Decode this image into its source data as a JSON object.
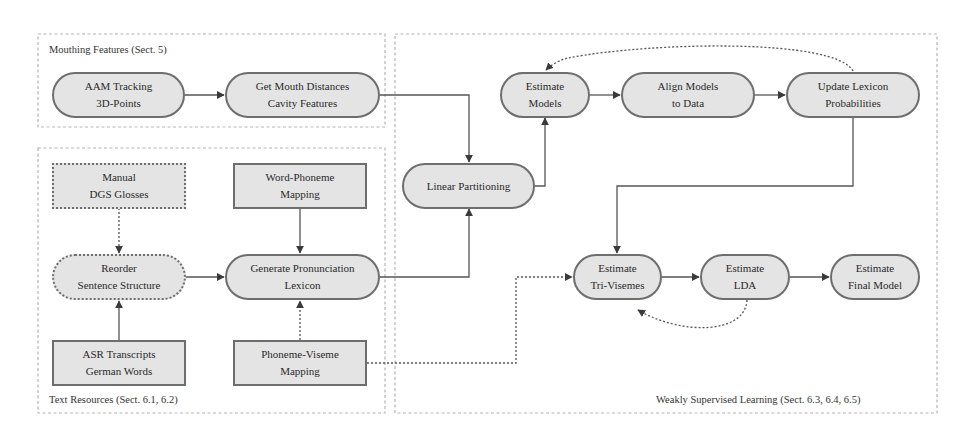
{
  "groups": {
    "mouthing": {
      "label": "Mouthing Features (Sect. 5)"
    },
    "text_resources": {
      "label": "Text Resources (Sect. 6.1, 6.2)"
    },
    "weakly_supervised": {
      "label": "Weakly Supervised Learning (Sect. 6.3, 6.4, 6.5)"
    }
  },
  "nodes": {
    "aam_tracking": {
      "line1": "AAM Tracking",
      "line2": "3D-Points",
      "shape": "pill"
    },
    "mouth_distances": {
      "line1": "Get Mouth Distances",
      "line2": "Cavity Features",
      "shape": "pill"
    },
    "manual_dgs": {
      "line1": "Manual",
      "line2": "DGS Glosses",
      "shape": "dotted-rect"
    },
    "word_phoneme": {
      "line1": "Word-Phoneme",
      "line2": "Mapping",
      "shape": "rect"
    },
    "reorder": {
      "line1": "Reorder",
      "line2": "Sentence Structure",
      "shape": "dotted-pill"
    },
    "generate_lexicon": {
      "line1": "Generate Pronunciation",
      "line2": "Lexicon",
      "shape": "pill"
    },
    "asr_transcripts": {
      "line1": "ASR Transcripts",
      "line2": "German Words",
      "shape": "rect"
    },
    "phoneme_viseme": {
      "line1": "Phoneme-Viseme",
      "line2": "Mapping",
      "shape": "rect"
    },
    "linear_partitioning": {
      "line1": "Linear Partitioning",
      "shape": "pill"
    },
    "estimate_models": {
      "line1": "Estimate",
      "line2": "Models",
      "shape": "pill"
    },
    "align_models": {
      "line1": "Align Models",
      "line2": "to Data",
      "shape": "pill"
    },
    "update_lexicon": {
      "line1": "Update Lexicon",
      "line2": "Probabilities",
      "shape": "pill"
    },
    "estimate_trivisemes": {
      "line1": "Estimate",
      "line2": "Tri-Visemes",
      "shape": "pill"
    },
    "estimate_lda": {
      "line1": "Estimate",
      "line2": "LDA",
      "shape": "pill"
    },
    "estimate_final": {
      "line1": "Estimate",
      "line2": "Final Model",
      "shape": "pill"
    }
  },
  "edges": [
    {
      "from": "aam_tracking",
      "to": "mouth_distances",
      "style": "solid"
    },
    {
      "from": "mouth_distances",
      "to": "linear_partitioning",
      "style": "solid"
    },
    {
      "from": "manual_dgs",
      "to": "reorder",
      "style": "dotted"
    },
    {
      "from": "asr_transcripts",
      "to": "reorder",
      "style": "solid"
    },
    {
      "from": "reorder",
      "to": "generate_lexicon",
      "style": "solid"
    },
    {
      "from": "word_phoneme",
      "to": "generate_lexicon",
      "style": "solid"
    },
    {
      "from": "phoneme_viseme",
      "to": "generate_lexicon",
      "style": "dotted"
    },
    {
      "from": "generate_lexicon",
      "to": "linear_partitioning",
      "style": "solid"
    },
    {
      "from": "linear_partitioning",
      "to": "estimate_models",
      "style": "solid"
    },
    {
      "from": "estimate_models",
      "to": "align_models",
      "style": "solid"
    },
    {
      "from": "align_models",
      "to": "update_lexicon",
      "style": "solid"
    },
    {
      "from": "update_lexicon",
      "to": "estimate_models",
      "style": "dotted"
    },
    {
      "from": "update_lexicon",
      "to": "estimate_trivisemes",
      "style": "solid"
    },
    {
      "from": "phoneme_viseme",
      "to": "estimate_trivisemes",
      "style": "dotted"
    },
    {
      "from": "estimate_trivisemes",
      "to": "estimate_lda",
      "style": "solid"
    },
    {
      "from": "estimate_lda",
      "to": "estimate_trivisemes",
      "style": "dotted"
    },
    {
      "from": "estimate_lda",
      "to": "estimate_final",
      "style": "solid"
    }
  ],
  "colors": {
    "node_fill": "#e4e4e4",
    "node_border": "#6e6e6e",
    "edge": "#555555",
    "group_border": "#b5b5b5"
  }
}
